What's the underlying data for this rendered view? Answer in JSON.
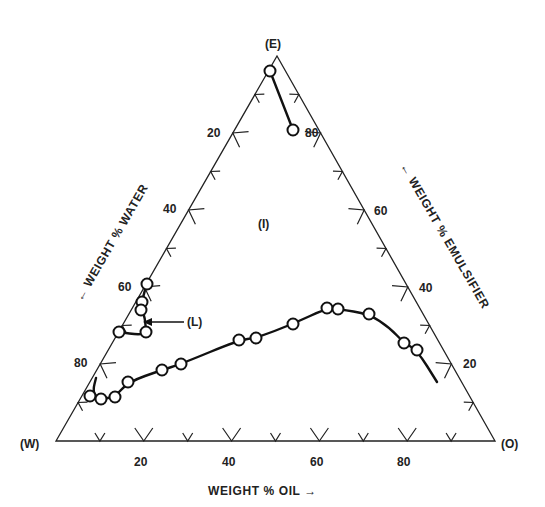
{
  "chart_data": {
    "type": "scatter",
    "subtype": "ternary-phase-diagram",
    "title": "",
    "vertices": {
      "top": "(E)",
      "left": "(W)",
      "right": "(O)"
    },
    "axes": {
      "bottom": {
        "label": "WEIGHT % OIL →",
        "ticks": [
          "20",
          "40",
          "60",
          "80"
        ]
      },
      "left": {
        "label": "← WEIGHT % WATER",
        "ticks": [
          "20",
          "40",
          "60",
          "80"
        ]
      },
      "right": {
        "label": "← WEIGHT % EMULSIFIER",
        "ticks": [
          "80",
          "60",
          "40",
          "20"
        ]
      }
    },
    "region_labels": [
      {
        "text": "(I)",
        "x": 266,
        "y": 225
      },
      {
        "text": "(L)",
        "x": 193,
        "y": 325
      }
    ],
    "series": [
      {
        "name": "top boundary",
        "points_px": [
          [
            270,
            71
          ],
          [
            293,
            130
          ]
        ],
        "line_px": [
          [
            270,
            71
          ],
          [
            293,
            130
          ]
        ]
      },
      {
        "name": "liquid crystal (L) region",
        "points_px": [
          [
            147,
            284
          ],
          [
            142,
            302
          ],
          [
            141,
            310
          ],
          [
            119,
            332
          ],
          [
            146,
            332
          ]
        ],
        "line_px": [
          [
            147,
            284
          ],
          [
            143,
            296
          ],
          [
            142,
            310
          ],
          [
            145,
            318
          ],
          [
            146,
            332
          ],
          [
            140,
            335
          ],
          [
            119,
            332
          ]
        ]
      },
      {
        "name": "lower phase boundary",
        "points_px": [
          [
            90,
            396
          ],
          [
            101,
            399
          ],
          [
            115,
            397
          ],
          [
            128,
            382
          ],
          [
            162,
            370
          ],
          [
            181,
            364
          ],
          [
            239,
            340
          ],
          [
            256,
            338
          ],
          [
            293,
            324
          ],
          [
            327,
            308
          ],
          [
            338,
            309
          ],
          [
            369,
            314
          ],
          [
            404,
            343
          ],
          [
            417,
            350
          ]
        ],
        "line_px": [
          [
            96,
            378
          ],
          [
            93,
            390
          ],
          [
            96,
            397
          ],
          [
            101,
            399
          ],
          [
            115,
            397
          ],
          [
            128,
            382
          ],
          [
            162,
            370
          ],
          [
            181,
            364
          ],
          [
            239,
            340
          ],
          [
            256,
            338
          ],
          [
            293,
            324
          ],
          [
            327,
            308
          ],
          [
            338,
            309
          ],
          [
            369,
            314
          ],
          [
            390,
            328
          ],
          [
            404,
            343
          ],
          [
            417,
            350
          ],
          [
            437,
            382
          ]
        ]
      }
    ],
    "annotations": [
      {
        "text": "(L)",
        "arrow_to_px": [
          148,
          322
        ]
      }
    ]
  }
}
